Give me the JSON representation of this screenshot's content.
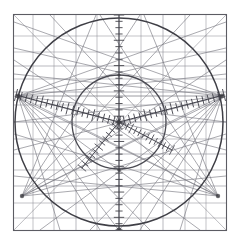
{
  "document": {
    "title": "Geometric Projection Diagram",
    "kind": "scanned-technical-drawing",
    "background_color": "#ffffff",
    "ink_color": "#3a3a3f",
    "faint_ink_color": "#8d8d94",
    "mid_ink_color": "#6b6b72"
  },
  "canvas": {
    "width": 239,
    "height": 240
  },
  "frame": {
    "name": "plate-border",
    "left": 13.5,
    "top": 14.5,
    "right": 226.5,
    "bottom": 230.5,
    "stroke_color": "#5c5c63",
    "stroke_width": 1.1
  },
  "projection": {
    "center_x": 119,
    "center_y": 122,
    "outer_circle": {
      "label": "primitive-circle",
      "radius": 104,
      "stroke_color": "#3f3f46",
      "stroke_width": 1.5
    },
    "inner_circle": {
      "label": "inner-circle",
      "radius": 47,
      "stroke_color": "#4a4a52",
      "stroke_width": 1.3
    }
  },
  "axes": {
    "vertical": {
      "label": "vertical-graduated-axis",
      "x": 119,
      "y_top": 15,
      "y_bottom": 230,
      "tick_count": 34,
      "tick_half_length": 3.2,
      "stroke_color": "#45454c"
    },
    "oblique_left": {
      "label": "left-graduated-scale",
      "x1": 16,
      "y1": 95,
      "x2": 119,
      "y2": 122,
      "tick_count": 20,
      "tick_half_length": 4.0,
      "stroke_color": "#41414a"
    },
    "oblique_right": {
      "label": "right-graduated-scale",
      "x1": 224,
      "y1": 95,
      "x2": 119,
      "y2": 122,
      "tick_count": 20,
      "tick_half_length": 4.0,
      "stroke_color": "#41414a"
    },
    "oblique_inner_left": {
      "label": "lower-left-graduated-scale",
      "x1": 82,
      "y1": 168,
      "x2": 119,
      "y2": 122,
      "tick_count": 11,
      "tick_half_length": 3.4,
      "stroke_color": "#4a4a52"
    },
    "oblique_inner_right": {
      "label": "lower-right-graduated-scale",
      "x1": 172,
      "y1": 150,
      "x2": 119,
      "y2": 122,
      "tick_count": 13,
      "tick_half_length": 3.4,
      "stroke_color": "#4a4a52"
    }
  },
  "grid": {
    "horizontal_lines": [
      {
        "y": 36,
        "weight": 0.6
      },
      {
        "y": 52,
        "weight": 0.6
      },
      {
        "y": 66,
        "weight": 0.7
      },
      {
        "y": 79,
        "weight": 0.6
      },
      {
        "y": 92,
        "weight": 0.8
      },
      {
        "y": 105,
        "weight": 0.6
      },
      {
        "y": 122,
        "weight": 0.9
      },
      {
        "y": 139,
        "weight": 0.6
      },
      {
        "y": 154,
        "weight": 0.7
      },
      {
        "y": 170,
        "weight": 0.6
      },
      {
        "y": 186,
        "weight": 0.7
      },
      {
        "y": 203,
        "weight": 0.6
      },
      {
        "y": 218,
        "weight": 0.6
      }
    ],
    "vertical_lines": [
      {
        "x": 33,
        "weight": 0.6
      },
      {
        "x": 54,
        "weight": 0.6
      },
      {
        "x": 76,
        "weight": 0.7
      },
      {
        "x": 97,
        "weight": 0.6
      },
      {
        "x": 119,
        "weight": 0.9
      },
      {
        "x": 141,
        "weight": 0.6
      },
      {
        "x": 163,
        "weight": 0.7
      },
      {
        "x": 185,
        "weight": 0.6
      },
      {
        "x": 206,
        "weight": 0.6
      }
    ],
    "stroke_color": "#8a8a92"
  },
  "radial_fan": {
    "description": "oblique straight lines radiating across the plate",
    "left_hub": {
      "x": 18,
      "y": 96
    },
    "right_hub": {
      "x": 222,
      "y": 96
    },
    "lower_left_hub": {
      "x": 22,
      "y": 196
    },
    "lower_right_hub": {
      "x": 218,
      "y": 196
    },
    "stroke_color": "#77777f",
    "stroke_width": 0.7,
    "left_fan_targets": [
      {
        "x": 226,
        "y": 22
      },
      {
        "x": 226,
        "y": 48
      },
      {
        "x": 226,
        "y": 74
      },
      {
        "x": 226,
        "y": 122
      },
      {
        "x": 226,
        "y": 150
      },
      {
        "x": 200,
        "y": 230
      },
      {
        "x": 150,
        "y": 230
      },
      {
        "x": 100,
        "y": 230
      },
      {
        "x": 60,
        "y": 230
      }
    ],
    "right_fan_targets": [
      {
        "x": 14,
        "y": 22
      },
      {
        "x": 14,
        "y": 48
      },
      {
        "x": 14,
        "y": 74
      },
      {
        "x": 14,
        "y": 122
      },
      {
        "x": 14,
        "y": 150
      },
      {
        "x": 40,
        "y": 230
      },
      {
        "x": 90,
        "y": 230
      },
      {
        "x": 140,
        "y": 230
      },
      {
        "x": 180,
        "y": 230
      }
    ],
    "lower_left_fan_targets": [
      {
        "x": 226,
        "y": 60
      },
      {
        "x": 226,
        "y": 96
      },
      {
        "x": 226,
        "y": 134
      },
      {
        "x": 226,
        "y": 176
      },
      {
        "x": 190,
        "y": 15
      },
      {
        "x": 140,
        "y": 15
      },
      {
        "x": 96,
        "y": 15
      }
    ],
    "lower_right_fan_targets": [
      {
        "x": 14,
        "y": 60
      },
      {
        "x": 14,
        "y": 96
      },
      {
        "x": 14,
        "y": 134
      },
      {
        "x": 14,
        "y": 176
      },
      {
        "x": 50,
        "y": 15
      },
      {
        "x": 100,
        "y": 15
      },
      {
        "x": 144,
        "y": 15
      }
    ]
  },
  "node_marks": [
    {
      "x": 18,
      "y": 96,
      "r": 2.4
    },
    {
      "x": 222,
      "y": 96,
      "r": 2.4
    },
    {
      "x": 22,
      "y": 196,
      "r": 2.2
    },
    {
      "x": 218,
      "y": 196,
      "r": 2.2
    },
    {
      "x": 119,
      "y": 122,
      "r": 2.0
    },
    {
      "x": 119,
      "y": 230,
      "r": 2.6
    },
    {
      "x": 119,
      "y": 170,
      "r": 1.8
    },
    {
      "x": 119,
      "y": 75,
      "r": 1.6
    }
  ]
}
